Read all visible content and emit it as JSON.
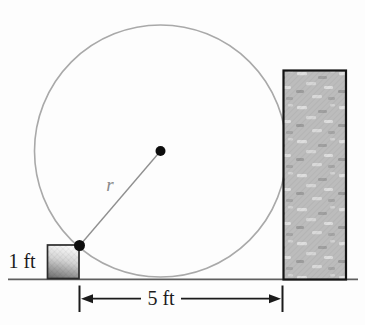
{
  "diagram": {
    "type": "geometry-figure",
    "labels": {
      "block_height": "1 ft",
      "radius": "r",
      "distance": "5 ft"
    },
    "colors": {
      "background": "#fdfdfd",
      "circle_stroke": "#a9a9a9",
      "radius_line": "#909090",
      "radius_label_text": "#8a8a8a",
      "dot_fill": "#0d0d0d",
      "block_border": "#2b2b2b",
      "block_gradient_top": "#fbfbfb",
      "block_gradient_bottom": "#747474",
      "wall_fill": "#bcbcbc",
      "wall_speckle_light": "#dedede",
      "wall_speckle_dark": "#9c9c9c",
      "wall_border": "#131313",
      "ground_line": "#5f5f5f",
      "dimension_line": "#1b1b1b",
      "label_text": "#1b1b1b"
    }
  }
}
